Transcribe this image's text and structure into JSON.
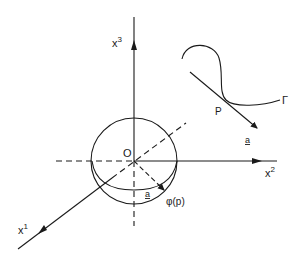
{
  "diagram": {
    "type": "coordinate-system-with-unit-sphere",
    "colors": {
      "stroke": "#1a1a1a",
      "background": "#ffffff"
    },
    "axes": [
      {
        "id": "x1",
        "label_base": "x",
        "label_sup": "1"
      },
      {
        "id": "x2",
        "label_base": "x",
        "label_sup": "2"
      },
      {
        "id": "x3",
        "label_base": "x",
        "label_sup": "3"
      }
    ],
    "origin_label": "O",
    "sphere_vector_label": "a",
    "image_point_label": "φ(p)",
    "curve_label": "Γ",
    "point_label": "P",
    "tangent_vector_label": "a"
  }
}
